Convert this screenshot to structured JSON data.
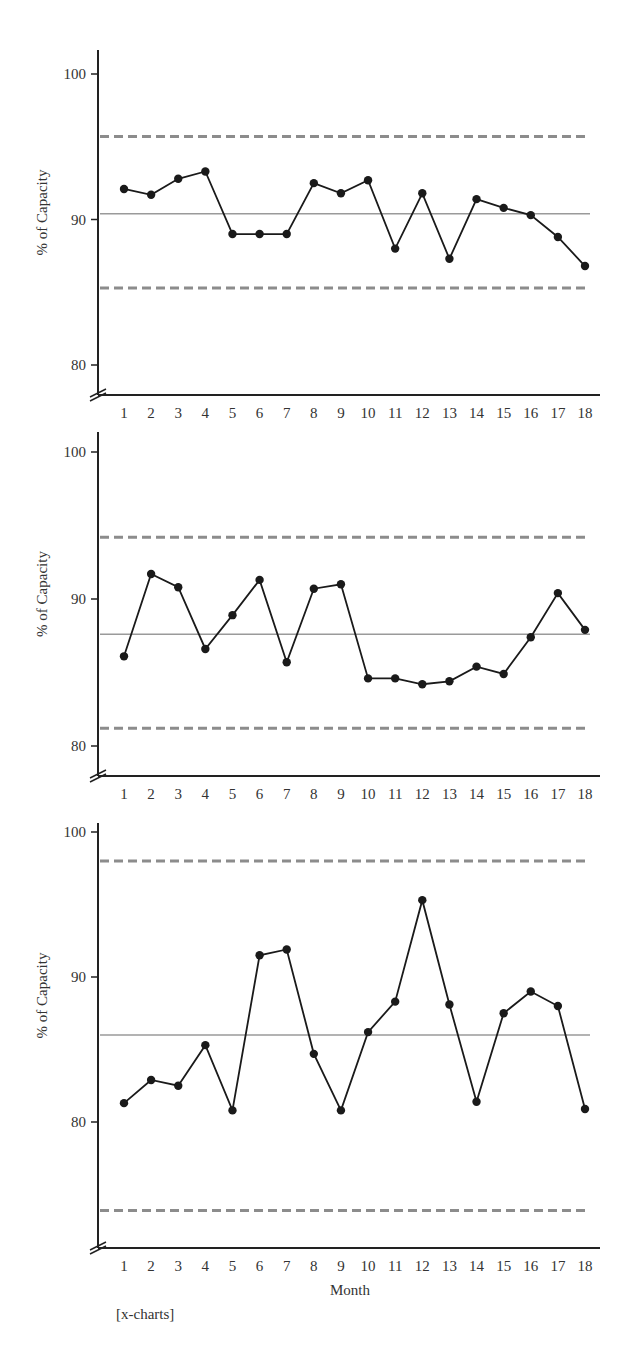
{
  "chart_data": [
    {
      "type": "line",
      "title": "",
      "xlabel": "",
      "ylabel": "% of Capacity",
      "x": [
        1,
        2,
        3,
        4,
        5,
        6,
        7,
        8,
        9,
        10,
        11,
        12,
        13,
        14,
        15,
        16,
        17,
        18
      ],
      "yticks": [
        80,
        90,
        100
      ],
      "ylim": [
        78.5,
        101
      ],
      "series": [
        {
          "name": "Observed",
          "values": [
            92.1,
            91.7,
            92.8,
            93.3,
            89.0,
            89.0,
            89.0,
            92.5,
            91.8,
            92.7,
            88.0,
            91.8,
            87.3,
            91.4,
            90.8,
            90.3,
            88.8,
            86.8
          ]
        }
      ],
      "control_limits": {
        "ucl": 95.7,
        "center": 90.4,
        "lcl": 85.3
      },
      "pixel": {
        "top": 50,
        "bottom": 395,
        "y100": 74,
        "y90": 219,
        "y80": 365
      }
    },
    {
      "type": "line",
      "title": "",
      "xlabel": "",
      "ylabel": "% of Capacity",
      "x": [
        1,
        2,
        3,
        4,
        5,
        6,
        7,
        8,
        9,
        10,
        11,
        12,
        13,
        14,
        15,
        16,
        17,
        18
      ],
      "yticks": [
        80,
        90,
        100
      ],
      "ylim": [
        78,
        101
      ],
      "series": [
        {
          "name": "Observed",
          "values": [
            86.1,
            91.7,
            90.8,
            86.6,
            88.9,
            91.3,
            85.7,
            90.7,
            91.0,
            84.6,
            84.6,
            84.2,
            84.4,
            85.4,
            84.9,
            87.4,
            90.4,
            87.9
          ]
        }
      ],
      "control_limits": {
        "ucl": 94.2,
        "center": 87.6,
        "lcl": 81.2
      },
      "pixel": {
        "top": 432,
        "bottom": 776,
        "y100": 452,
        "y90": 599,
        "y80": 746
      }
    },
    {
      "type": "line",
      "title": "",
      "xlabel": "Month",
      "ylabel": "% of Capacity",
      "x": [
        1,
        2,
        3,
        4,
        5,
        6,
        7,
        8,
        9,
        10,
        11,
        12,
        13,
        14,
        15,
        16,
        17,
        18
      ],
      "yticks": [
        80,
        90,
        100
      ],
      "ylim": [
        71,
        101
      ],
      "series": [
        {
          "name": "Observed",
          "values": [
            81.3,
            82.9,
            82.5,
            85.3,
            80.8,
            91.5,
            91.9,
            84.7,
            80.8,
            86.2,
            88.3,
            95.3,
            88.1,
            81.4,
            87.5,
            89.0,
            88.0,
            80.9
          ]
        }
      ],
      "control_limits": {
        "ucl": 98.0,
        "center": 86.0,
        "lcl": 73.9
      },
      "pixel": {
        "top": 823,
        "bottom": 1248,
        "y100": 832,
        "y90": 976,
        "y80": 1122
      }
    }
  ],
  "labels": {
    "ylabel": "% of Capacity",
    "xlabel": "Month",
    "note": "[x-charts]",
    "xticks": [
      "1",
      "2",
      "3",
      "4",
      "5",
      "6",
      "7",
      "8",
      "9",
      "10",
      "11",
      "12",
      "13",
      "14",
      "15",
      "16",
      "17",
      "18"
    ],
    "yticks": [
      "80",
      "90",
      "100"
    ]
  },
  "colors": {
    "axis": "#222222",
    "series": "#1a1a1a",
    "control_limit": "#8c8c8c",
    "center_line": "#9a9a9a"
  }
}
